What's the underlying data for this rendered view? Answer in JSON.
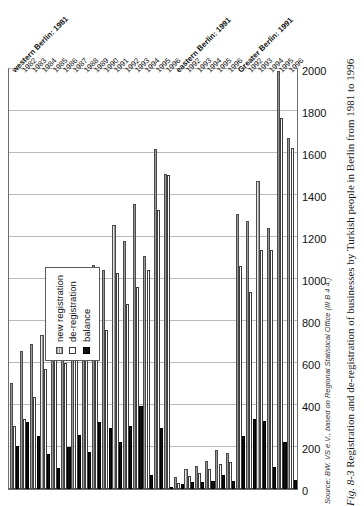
{
  "figure": {
    "fig_label": "Fig. 8-3",
    "caption": "Registration and de-registration of businesses by Turkish people in Berlin from 1981 to 1996",
    "source": "Source: BW. VS e.V., based on Regional Statistical Office (III B 4 4.)"
  },
  "legend": {
    "position": "inside-left",
    "items": [
      {
        "key": "new_registration",
        "label": "new registration",
        "style": "hatched-gray"
      },
      {
        "key": "de_registration",
        "label": "de-registration",
        "style": "white-outline"
      },
      {
        "key": "balance",
        "label": "balance",
        "style": "solid-black"
      }
    ]
  },
  "chart_data": {
    "type": "bar",
    "orientation": "horizontal",
    "title": "Registration and de-registration of businesses by Turkish people in Berlin from 1981 to 1996",
    "xlabel": "",
    "ylabel": "",
    "xlim": [
      0,
      2000
    ],
    "ticks": [
      0,
      200,
      400,
      600,
      800,
      1000,
      1200,
      1400,
      1600,
      1800,
      2000
    ],
    "grid": true,
    "legend_position": "inside-left",
    "series_names": [
      "new registration",
      "de-registration",
      "balance"
    ],
    "sections": [
      {
        "name": "western Berlin:",
        "categories": [
          "1981",
          "1982",
          "1983",
          "1984",
          "1985",
          "1986",
          "1987",
          "1988",
          "1989",
          "1990",
          "1991",
          "1992",
          "1993",
          "1994",
          "1995",
          "1996"
        ],
        "series": [
          {
            "name": "new registration",
            "values": [
              505,
              655,
              690,
              735,
              790,
              800,
              880,
              1035,
              1065,
              1045,
              1255,
              1180,
              1355,
              1110,
              1620,
              1500
            ]
          },
          {
            "name": "de-registration",
            "values": [
              300,
              335,
              440,
              570,
              690,
              600,
              625,
              860,
              745,
              755,
              1030,
              880,
              960,
              1045,
              1330,
              1495
            ]
          },
          {
            "name": "balance",
            "values": [
              205,
              320,
              250,
              165,
              100,
              200,
              255,
              175,
              320,
              290,
              225,
              300,
              395,
              65,
              290,
              5
            ]
          }
        ]
      },
      {
        "name": "eastern Berlin:",
        "categories": [
          "1991",
          "1992",
          "1993",
          "1994",
          "1995",
          "1996"
        ],
        "series": [
          {
            "name": "new registration",
            "values": [
              55,
              95,
              110,
              135,
              185,
              170
            ]
          },
          {
            "name": "de-registration",
            "values": [
              30,
              60,
              75,
              95,
              120,
              130
            ]
          },
          {
            "name": "balance",
            "values": [
              25,
              35,
              35,
              40,
              65,
              40
            ]
          }
        ]
      },
      {
        "name": "Greater Berlin:",
        "categories": [
          "1991",
          "1992",
          "1993",
          "1994",
          "1995",
          "1996"
        ],
        "series": [
          {
            "name": "new registration",
            "values": [
              1310,
              1275,
              1465,
              1245,
              1990,
              1670
            ]
          },
          {
            "name": "de-registration",
            "values": [
              1060,
              940,
              1140,
              1140,
              1765,
              1625
            ]
          },
          {
            "name": "balance",
            "values": [
              250,
              335,
              325,
              105,
              225,
              45
            ]
          }
        ]
      }
    ]
  }
}
